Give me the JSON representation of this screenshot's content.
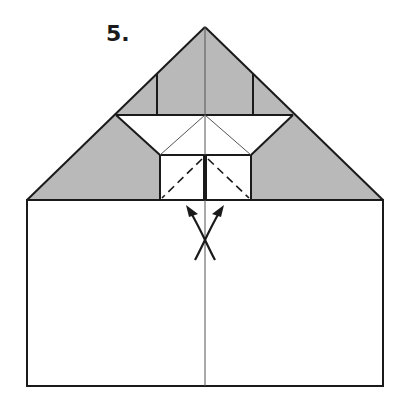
{
  "step": {
    "label": "5.",
    "x": 106,
    "y": 23
  },
  "colors": {
    "shade": "#b9b9b9",
    "line": "#1a1a1a",
    "thin_line": "#555555",
    "paper": "#ffffff"
  },
  "geometry": {
    "apex": [
      205,
      27
    ],
    "base_left": [
      27,
      200
    ],
    "base_right": [
      383,
      200
    ],
    "band_y": 115,
    "band_left_x": 116,
    "band_right_x": 293,
    "upper_verticals_x": [
      157,
      253
    ],
    "box": {
      "x1": 160,
      "y1": 155,
      "x2": 251,
      "y2": 200
    },
    "rect": {
      "x1": 27,
      "y1": 200,
      "x2": 383,
      "y2": 386
    },
    "center_x": 205
  },
  "annotations": {
    "fold_type": "valley folds (dashed) with open arrows",
    "arrows": "two curved arrows crossing, pointing up-left and up-right"
  }
}
